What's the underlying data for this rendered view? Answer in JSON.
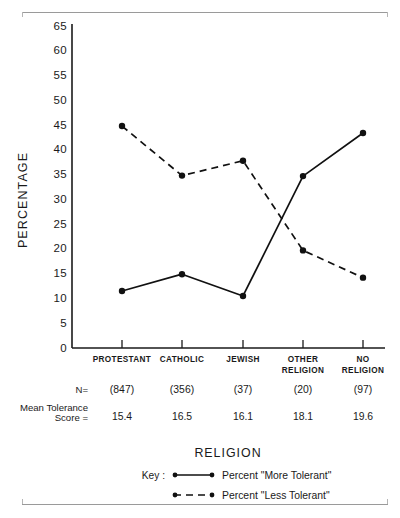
{
  "chart_data": {
    "type": "line",
    "title": "",
    "xlabel": "RELIGION",
    "ylabel": "PERCENTAGE",
    "ylim": [
      0,
      65
    ],
    "ytick_step": 5,
    "yticks": [
      "0",
      "5",
      "10",
      "15",
      "20",
      "25",
      "30",
      "35",
      "40",
      "45",
      "50",
      "55",
      "60",
      "65"
    ],
    "categories": [
      "PROTESTANT",
      "CATHOLIC",
      "JEWISH",
      "OTHER RELIGION",
      "NO RELIGION"
    ],
    "category_lines": [
      [
        "PROTESTANT"
      ],
      [
        "CATHOLIC"
      ],
      [
        "JEWISH"
      ],
      [
        "OTHER",
        "RELIGION"
      ],
      [
        "NO",
        "RELIGION"
      ]
    ],
    "grid": false,
    "legend_position": "bottom",
    "series": [
      {
        "name": "Percent \"More Tolerant\"",
        "style": "solid",
        "values": [
          11.5,
          14.9,
          10.5,
          34.7,
          43.4
        ]
      },
      {
        "name": "Percent \"Less Tolerant\"",
        "style": "dashed",
        "values": [
          44.8,
          34.8,
          37.8,
          19.7,
          14.2
        ]
      }
    ],
    "annotations": {
      "n_row_label": "N=",
      "n_values": [
        "(847)",
        "(356)",
        "(37)",
        "(20)",
        "(97)"
      ],
      "mean_row_label_line1": "Mean  Tolerance",
      "mean_row_label_line2": "Score =",
      "mean_values": [
        "15.4",
        "16.5",
        "16.1",
        "18.1",
        "19.6"
      ]
    },
    "legend": {
      "key_label": "Key :",
      "entries": [
        {
          "style": "solid",
          "text": "Percent  \"More  Tolerant\""
        },
        {
          "style": "dashed",
          "text": "Percent  \"Less  Tolerant\""
        }
      ]
    },
    "colors": {
      "line": "#111111",
      "axis": "#1a1a1a",
      "background": "#ffffff",
      "rule": "#9a9a9a"
    }
  }
}
